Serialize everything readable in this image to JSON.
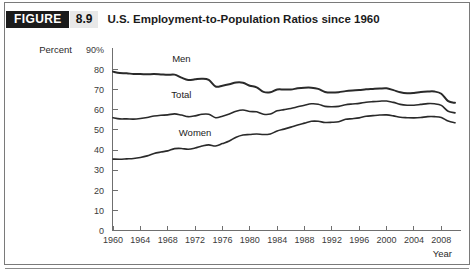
{
  "figure": {
    "tag_label": "FIGURE",
    "number": "8.9",
    "title": "U.S. Employment-to-Population Ratios since 1960"
  },
  "chart_data": {
    "type": "line",
    "title": "U.S. Employment-to-Population Ratios since 1960",
    "xlabel": "Year",
    "ylabel": "Percent",
    "ylim": [
      0,
      90
    ],
    "xlim": [
      1960,
      2010
    ],
    "grid": false,
    "legend_position": "inline-labels",
    "y_ticks": [
      "90%",
      "80",
      "70",
      "60",
      "50",
      "40",
      "30",
      "20",
      "10",
      "0"
    ],
    "y_tick_values": [
      90,
      80,
      70,
      60,
      50,
      40,
      30,
      20,
      10,
      0
    ],
    "x_ticks": [
      "1960",
      "1964",
      "1968",
      "1972",
      "1976",
      "1980",
      "1984",
      "1988",
      "1992",
      "1996",
      "2000",
      "2004",
      "2008"
    ],
    "x_tick_values": [
      1960,
      1964,
      1968,
      1972,
      1976,
      1980,
      1984,
      1988,
      1992,
      1996,
      2000,
      2004,
      2008
    ],
    "x": [
      1960,
      1961,
      1962,
      1963,
      1964,
      1965,
      1966,
      1967,
      1968,
      1969,
      1970,
      1971,
      1972,
      1973,
      1974,
      1975,
      1976,
      1977,
      1978,
      1979,
      1980,
      1981,
      1982,
      1983,
      1984,
      1985,
      1986,
      1987,
      1988,
      1989,
      1990,
      1991,
      1992,
      1993,
      1994,
      1995,
      1996,
      1997,
      1998,
      1999,
      2000,
      2001,
      2002,
      2003,
      2004,
      2005,
      2006,
      2007,
      2008,
      2009,
      2010
    ],
    "series": [
      {
        "name": "Men",
        "label": "Men",
        "label_x": 1970,
        "label_y": 84,
        "emphasis": "thick",
        "values": [
          79.0,
          78.3,
          78.2,
          77.8,
          77.8,
          77.7,
          77.8,
          77.6,
          77.4,
          77.5,
          76.0,
          74.8,
          75.2,
          75.5,
          74.9,
          71.6,
          72.0,
          72.7,
          73.6,
          73.5,
          72.0,
          71.2,
          68.9,
          68.7,
          70.1,
          70.1,
          70.1,
          70.7,
          71.0,
          71.0,
          70.4,
          68.9,
          68.6,
          68.8,
          69.3,
          69.6,
          69.8,
          70.2,
          70.4,
          70.6,
          70.7,
          69.8,
          68.7,
          68.2,
          68.4,
          68.9,
          69.1,
          69.1,
          68.0,
          64.3,
          63.5
        ]
      },
      {
        "name": "Total",
        "label": "Total",
        "label_x": 1970,
        "label_y": 66,
        "emphasis": "normal",
        "values": [
          56.1,
          55.5,
          55.5,
          55.4,
          55.7,
          56.2,
          56.9,
          57.3,
          57.5,
          58.0,
          57.4,
          56.6,
          57.0,
          57.8,
          57.8,
          56.1,
          56.8,
          57.9,
          59.3,
          59.9,
          59.2,
          59.0,
          57.8,
          57.9,
          59.5,
          60.1,
          60.7,
          61.5,
          62.3,
          63.0,
          62.8,
          61.7,
          61.5,
          61.7,
          62.5,
          62.9,
          63.2,
          63.8,
          64.1,
          64.3,
          64.4,
          63.7,
          62.7,
          62.3,
          62.3,
          62.7,
          63.1,
          63.0,
          62.2,
          59.3,
          58.5
        ]
      },
      {
        "name": "Women",
        "label": "Women",
        "label_x": 1972,
        "label_y": 47,
        "emphasis": "normal",
        "values": [
          35.5,
          35.4,
          35.6,
          35.8,
          36.3,
          37.1,
          38.3,
          39.0,
          39.6,
          40.7,
          40.8,
          40.4,
          41.0,
          42.0,
          42.6,
          42.0,
          43.2,
          44.5,
          46.4,
          47.5,
          47.7,
          48.0,
          47.7,
          48.0,
          49.5,
          50.4,
          51.4,
          52.5,
          53.4,
          54.3,
          54.3,
          53.7,
          53.8,
          54.1,
          55.3,
          55.6,
          56.0,
          56.8,
          57.1,
          57.4,
          57.5,
          57.0,
          56.3,
          56.1,
          56.0,
          56.2,
          56.6,
          56.6,
          56.2,
          54.4,
          53.6
        ]
      }
    ]
  }
}
